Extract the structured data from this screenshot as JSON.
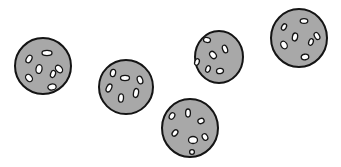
{
  "scene": {
    "description": "Five gray round cookies with white oval spots on a white background",
    "background": "#ffffff",
    "cookie_fill": "#a8a8a8",
    "outline": "#141414",
    "spot_fill": "#ffffff",
    "cookies": [
      {
        "cx": 43,
        "cy": 66,
        "rx": 28,
        "ry": 28,
        "spots": [
          [
            47,
            53,
            5,
            2.6,
            0
          ],
          [
            29,
            59,
            2.6,
            4,
            30
          ],
          [
            39,
            69,
            3,
            4.5,
            10
          ],
          [
            59,
            69,
            3,
            4.2,
            -40
          ],
          [
            53,
            74,
            2.4,
            3.6,
            20
          ],
          [
            29,
            78,
            3,
            4,
            -40
          ],
          [
            52,
            87,
            4.2,
            3,
            -10
          ]
        ]
      },
      {
        "cx": 126,
        "cy": 87,
        "rx": 27,
        "ry": 27,
        "spots": [
          [
            113,
            73,
            2.6,
            3.6,
            10
          ],
          [
            125,
            78,
            4.5,
            2.6,
            0
          ],
          [
            140,
            80,
            2.6,
            4,
            -20
          ],
          [
            109,
            88,
            2.5,
            4.2,
            25
          ],
          [
            136,
            93,
            2.5,
            4.5,
            10
          ],
          [
            121,
            98,
            2.5,
            4.2,
            5
          ]
        ]
      },
      {
        "cx": 190,
        "cy": 128,
        "rx": 28,
        "ry": 29,
        "spots": [
          [
            172,
            116,
            2.5,
            3.5,
            30
          ],
          [
            188,
            113,
            2.4,
            4,
            0
          ],
          [
            201,
            121,
            3.2,
            2.6,
            -20
          ],
          [
            175,
            133,
            2.4,
            3.5,
            40
          ],
          [
            193,
            140,
            4.5,
            3.5,
            0
          ],
          [
            205,
            137,
            2.6,
            3.4,
            -30
          ],
          [
            192,
            152,
            2.4,
            2.4,
            0
          ]
        ]
      },
      {
        "cx": 219,
        "cy": 57,
        "rx": 24,
        "ry": 26,
        "spots": [
          [
            207,
            40,
            3.5,
            2.5,
            10
          ],
          [
            225,
            49,
            2.4,
            4,
            -20
          ],
          [
            213,
            55,
            2.8,
            4,
            -40
          ],
          [
            197,
            62,
            2.2,
            3.4,
            20
          ],
          [
            208,
            69,
            2.2,
            3.4,
            20
          ],
          [
            220,
            71,
            3.5,
            2.6,
            -10
          ]
        ]
      },
      {
        "cx": 299,
        "cy": 38,
        "rx": 28,
        "ry": 29,
        "spots": [
          [
            304,
            21,
            3.8,
            2.4,
            0
          ],
          [
            284,
            27,
            2.2,
            3.4,
            30
          ],
          [
            295,
            37,
            2.6,
            4,
            10
          ],
          [
            317,
            36,
            2.4,
            3.8,
            -30
          ],
          [
            311,
            42,
            2.2,
            3.4,
            20
          ],
          [
            284,
            45,
            3,
            4,
            -30
          ],
          [
            305,
            57,
            3.8,
            2.8,
            -10
          ]
        ]
      }
    ]
  }
}
